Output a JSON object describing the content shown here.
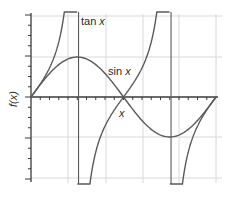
{
  "chart_data": {
    "type": "line",
    "title": "",
    "xlabel": "x",
    "ylabel": "f(x)",
    "xlim": [
      0,
      6.2832
    ],
    "ylim": [
      -2.05,
      2.05
    ],
    "grid": true,
    "legend": "inline labels",
    "x_gridlines": [
      1.3,
      2.5,
      3.7,
      4.9,
      6.2832
    ],
    "y_gridlines": [
      -2,
      -1,
      1,
      2
    ],
    "asymptotes": [
      1.5708,
      4.7124
    ],
    "series": [
      {
        "name": "sin x",
        "label": "sin x",
        "function": "sin",
        "x": [
          0,
          0.7854,
          1.5708,
          2.3562,
          3.1416,
          3.927,
          4.7124,
          5.4978,
          6.2832
        ],
        "values": [
          0,
          0.707,
          1,
          0.707,
          0,
          -0.707,
          -1,
          -0.707,
          0
        ]
      },
      {
        "name": "tan x",
        "label": "tan x",
        "function": "tan",
        "x": [
          0,
          0.7854,
          1.4,
          1.5,
          1.64,
          2.3562,
          3.1416,
          3.927,
          4.6,
          4.8,
          5.4978,
          6.2832
        ],
        "values": [
          0,
          1,
          5.8,
          14.1,
          -14.1,
          -1,
          0,
          1,
          8.9,
          -11.4,
          -1,
          0
        ]
      }
    ],
    "annotations": [
      {
        "text": "tan x",
        "near": "top of first asymptote"
      },
      {
        "text": "sin x",
        "near": "descending sin curve"
      },
      {
        "text": "x",
        "near": "below x-axis"
      }
    ]
  },
  "labels": {
    "tan": "tan x",
    "tan_fn": "tan ",
    "tan_var": "x",
    "sin_fn": "sin ",
    "sin_var": "x",
    "x_axis": "x",
    "y_axis": "f(x)"
  },
  "colors": {
    "curve": "#5a5a5a",
    "axis": "#3a3a3a",
    "grid": "#d8d8d8"
  }
}
